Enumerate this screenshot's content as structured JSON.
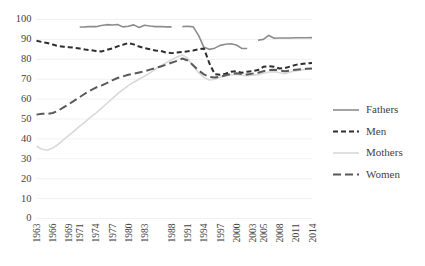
{
  "chart_data": {
    "type": "line",
    "title": "",
    "xlabel": "",
    "ylabel": "",
    "ylim": [
      0,
      100
    ],
    "ytick_values": [
      0,
      10,
      20,
      30,
      40,
      50,
      60,
      70,
      80,
      90,
      100
    ],
    "ytick_labels": [
      "0",
      "10",
      "20",
      "30",
      "40",
      "50",
      "60",
      "70",
      "80",
      "90",
      "100"
    ],
    "grid": true,
    "grid_axis": "y",
    "legend_position": "right",
    "x": [
      1963,
      1964,
      1965,
      1966,
      1967,
      1968,
      1969,
      1970,
      1971,
      1972,
      1973,
      1974,
      1975,
      1976,
      1977,
      1978,
      1979,
      1980,
      1981,
      1982,
      1983,
      1984,
      1985,
      1986,
      1987,
      1988,
      1989,
      1990,
      1991,
      1992,
      1993,
      1994,
      1995,
      1996,
      1997,
      1998,
      1999,
      2000,
      2001,
      2002,
      2003,
      2004,
      2005,
      2006,
      2007,
      2008,
      2009,
      2010,
      2011,
      2012,
      2013,
      2014
    ],
    "xtick_labels": [
      "1963",
      "1966",
      "1969",
      "1971",
      "1974",
      "1977",
      "1980",
      "1983",
      "1988",
      "1991",
      "1994",
      "1997",
      "2000",
      "2003",
      "2005",
      "2008",
      "2011",
      "2014"
    ],
    "xtick_values": [
      1963,
      1966,
      1969,
      1971,
      1974,
      1977,
      1980,
      1983,
      1988,
      1991,
      1994,
      1997,
      2000,
      2003,
      2005,
      2008,
      2011,
      2014
    ],
    "series": [
      {
        "name": "Fathers",
        "color": "#8c8c8c",
        "style": "solid",
        "dash": "",
        "width": 1.6,
        "values": [
          null,
          null,
          null,
          null,
          null,
          null,
          null,
          null,
          96.2,
          96.3,
          96.5,
          96.4,
          97.0,
          97.4,
          97.2,
          97.5,
          96.3,
          96.6,
          97.3,
          96.0,
          97.1,
          96.7,
          96.4,
          96.5,
          96.3,
          96.3,
          null,
          96.4,
          96.6,
          96.3,
          92.0,
          86.0,
          85.0,
          85.6,
          87.0,
          87.6,
          87.8,
          87.2,
          85.5,
          85.4,
          null,
          89.6,
          90.0,
          92.0,
          90.6,
          90.7,
          90.7,
          90.7,
          90.8,
          90.8,
          90.8,
          90.9
        ]
      },
      {
        "name": "Men",
        "color": "#2e2e2e",
        "style": "dashed",
        "dash": "5,3",
        "width": 2.0,
        "values": [
          89.3,
          88.7,
          88.2,
          87.4,
          86.6,
          86.3,
          86.1,
          85.8,
          85.4,
          84.9,
          84.6,
          84.2,
          83.9,
          84.7,
          85.4,
          86.5,
          87.3,
          88.2,
          87.5,
          86.4,
          85.6,
          85.0,
          84.4,
          84.2,
          83.4,
          83.1,
          83.4,
          83.7,
          84.0,
          84.4,
          85.0,
          85.4,
          78.0,
          72.5,
          72.2,
          72.8,
          73.8,
          74.0,
          73.2,
          73.8,
          74.0,
          74.6,
          76.2,
          76.5,
          76.2,
          75.4,
          75.6,
          76.4,
          77.2,
          77.6,
          78.0,
          78.2
        ]
      },
      {
        "name": "Mothers",
        "color": "#d9d9d9",
        "style": "solid",
        "dash": "",
        "width": 1.6,
        "values": [
          36.3,
          34.8,
          34.3,
          35.4,
          37.2,
          39.5,
          41.8,
          44.0,
          46.4,
          48.5,
          50.9,
          53.0,
          55.3,
          57.8,
          60.2,
          62.6,
          64.8,
          66.8,
          68.5,
          70.0,
          71.5,
          73.2,
          75.0,
          76.8,
          78.3,
          79.8,
          81.2,
          82.2,
          80.4,
          76.6,
          73.3,
          70.8,
          69.6,
          70.0,
          71.0,
          71.8,
          72.2,
          72.4,
          72.0,
          71.8,
          72.0,
          72.3,
          73.0,
          73.6,
          73.8,
          73.2,
          72.8,
          73.6,
          74.2,
          74.6,
          75.0,
          75.2
        ]
      },
      {
        "name": "Women",
        "color": "#595959",
        "style": "dashed",
        "dash": "8,4",
        "width": 2.0,
        "values": [
          52.2,
          52.6,
          52.6,
          53.0,
          54.2,
          55.8,
          57.5,
          59.2,
          61.0,
          62.8,
          64.4,
          65.8,
          66.8,
          68.0,
          69.4,
          70.6,
          71.4,
          72.2,
          72.8,
          73.4,
          74.0,
          74.8,
          75.6,
          76.4,
          77.3,
          78.3,
          79.2,
          80.4,
          79.4,
          77.0,
          74.4,
          72.4,
          71.2,
          70.8,
          71.2,
          72.0,
          72.6,
          73.0,
          72.6,
          72.4,
          72.8,
          73.2,
          74.0,
          74.6,
          74.8,
          74.4,
          74.0,
          74.4,
          74.8,
          75.0,
          75.2,
          75.4
        ]
      }
    ]
  },
  "legend": {
    "entries": [
      {
        "label": "Fathers"
      },
      {
        "label": "Men"
      },
      {
        "label": "Mothers"
      },
      {
        "label": "Women"
      }
    ]
  }
}
